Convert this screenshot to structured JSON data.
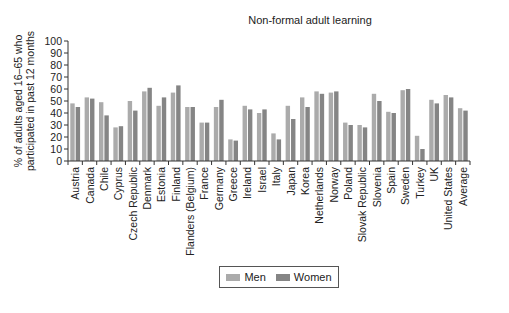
{
  "chart_data": {
    "type": "bar",
    "title": "Non-formal adult learning",
    "xlabel": "",
    "ylabel": "% of adults aged 16–65 who participated in past 12 months",
    "ylabel_lines": [
      "% of adults aged 16–65 who",
      "participated in past 12 months"
    ],
    "ylim": [
      0,
      100
    ],
    "yticks": [
      0,
      10,
      20,
      30,
      40,
      50,
      60,
      70,
      80,
      90,
      100
    ],
    "grid": false,
    "legend_position": "bottom",
    "categories": [
      "Austria",
      "Canada",
      "Chile",
      "Cyprus",
      "Czech Republic",
      "Denmark",
      "Estonia",
      "Finland",
      "Flanders (Belgium)",
      "France",
      "Germany",
      "Greece",
      "Ireland",
      "Israel",
      "Italy",
      "Japan",
      "Korea",
      "Netherlands",
      "Norway",
      "Poland",
      "Slovak Republic",
      "Slovenia",
      "Spain",
      "Sweden",
      "Turkey",
      "UK",
      "United States",
      "Average"
    ],
    "series": [
      {
        "name": "Men",
        "color": "#ababab",
        "values": [
          48,
          53,
          49,
          28,
          50,
          58,
          46,
          57,
          45,
          32,
          45,
          18,
          46,
          40,
          23,
          46,
          53,
          58,
          57,
          32,
          30,
          56,
          41,
          59,
          21,
          51,
          55,
          44
        ]
      },
      {
        "name": "Women",
        "color": "#858585",
        "values": [
          45,
          52,
          38,
          29,
          42,
          61,
          53,
          63,
          45,
          32,
          51,
          17,
          43,
          43,
          18,
          35,
          45,
          56,
          58,
          30,
          28,
          50,
          40,
          60,
          10,
          48,
          53,
          42
        ]
      }
    ]
  },
  "legend": {
    "men_label": "Men",
    "women_label": "Women"
  }
}
